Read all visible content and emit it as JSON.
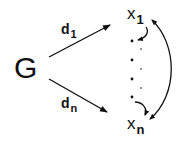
{
  "diagram": {
    "source_node": {
      "label": "G"
    },
    "targets": [
      {
        "base": "x",
        "sub": "1"
      },
      {
        "base": "x",
        "sub": "n"
      }
    ],
    "edges": [
      {
        "from": "G",
        "to": "x1",
        "base": "d",
        "sub": "1"
      },
      {
        "from": "G",
        "to": "xn",
        "base": "d",
        "sub": "n"
      }
    ],
    "ellipsis": "vertical dots between x1 and xn",
    "cyclic_arrows": [
      "x1 -> next",
      "prev -> xn",
      "x1 <-> xn"
    ]
  }
}
